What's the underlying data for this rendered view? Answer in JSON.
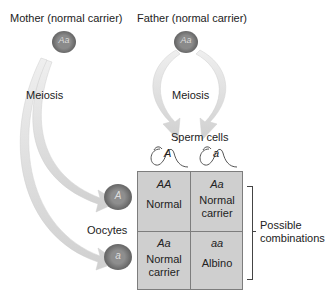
{
  "parents": {
    "mother": {
      "label": "Mother (normal carrier)",
      "genotype": "Aa"
    },
    "father": {
      "label": "Father (normal carrier)",
      "genotype": "Aa"
    }
  },
  "processes": {
    "mother_meiosis": "Meiosis",
    "father_meiosis": "Meiosis"
  },
  "gametes": {
    "sperm_label": "Sperm cells",
    "sperm": [
      {
        "allele": "A"
      },
      {
        "allele": "a"
      }
    ],
    "oocyte_label": "Oocytes",
    "oocytes": [
      {
        "allele": "A"
      },
      {
        "allele": "a"
      }
    ]
  },
  "punnett": {
    "cells": [
      {
        "genotype": "AA",
        "phenotype": "Normal"
      },
      {
        "genotype": "Aa",
        "phenotype": "Normal carrier"
      },
      {
        "genotype": "Aa",
        "phenotype": "Normal carrier"
      },
      {
        "genotype": "aa",
        "phenotype": "Albino"
      }
    ],
    "bracket_label": "Possible combinations"
  },
  "colors": {
    "cell_fill": "#cfcfcf",
    "cell_fill_nucleus": "#7a7a7a",
    "cell_outer": "#6e6e6e",
    "arrow": "#dcdcdc"
  }
}
